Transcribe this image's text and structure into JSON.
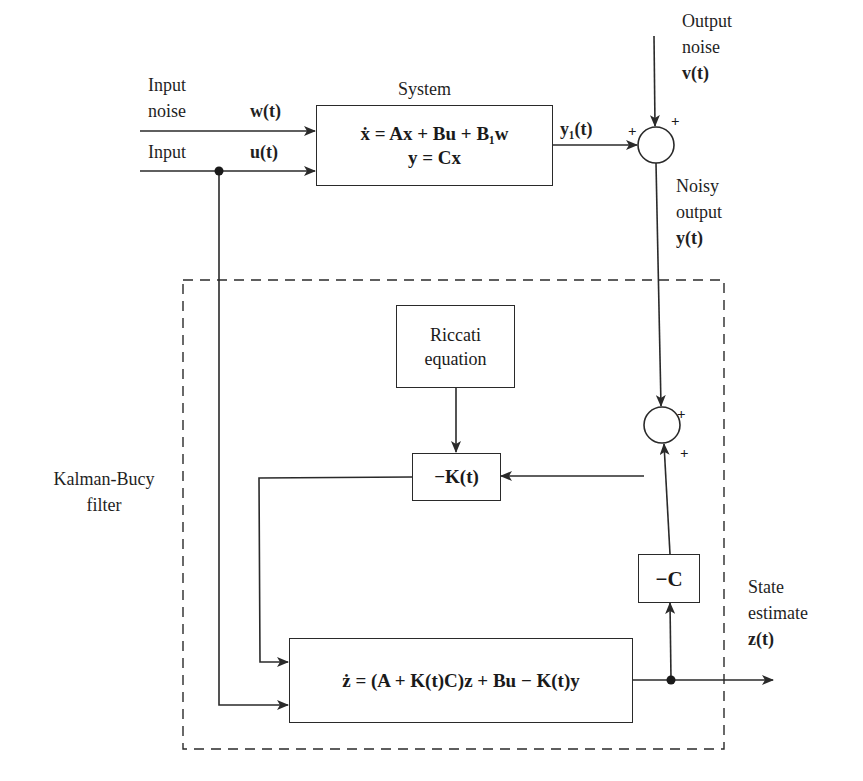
{
  "diagram": {
    "colors": {
      "line": "#2a2a2a",
      "background": "#ffffff",
      "text": "#1f1f1f"
    }
  },
  "inputs": {
    "input_noise_label_line1": "Input",
    "input_noise_label_line2": "noise",
    "input_noise_signal": "w(t)",
    "input_label": "Input",
    "input_signal": "u(t)"
  },
  "system": {
    "title": "System",
    "equation1": "ẋ = Ax + Bu + B₁w",
    "equation2": "y = Cx",
    "output_signal": "y₁(t)"
  },
  "output_noise": {
    "label_line1": "Output",
    "label_line2": "noise",
    "signal": "v(t)"
  },
  "noisy_output": {
    "label_line1": "Noisy",
    "label_line2": "output",
    "signal": "y(t)"
  },
  "summing_junctions": [
    {
      "id": "sum1",
      "signs": [
        "+",
        "+"
      ]
    },
    {
      "id": "sum2",
      "signs": [
        "+",
        "+"
      ]
    }
  ],
  "filter": {
    "label_line1": "Kalman-Bucy",
    "label_line2": "filter",
    "riccati_line1": "Riccati",
    "riccati_line2": "equation",
    "gain_block": "−K(t)",
    "output_matrix_block": "−C",
    "estimator_equation": "ż = (A + K(t)C)z + Bu − K(t)y"
  },
  "state_estimate": {
    "label_line1": "State",
    "label_line2": "estimate",
    "signal": "z(t)"
  }
}
